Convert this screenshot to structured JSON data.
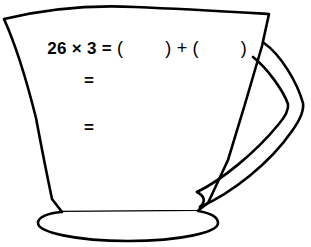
{
  "page": {
    "background_color": "#ffffff",
    "ink_color": "#000000"
  },
  "illustration": {
    "name": "cup-with-handle",
    "description": "Hand-drawn outline of a wide cup with an angular handle on the right side and an oval foot"
  },
  "equation": {
    "operand_1": "26",
    "times_symbol": "×",
    "operand_2": "3",
    "equals_symbol": "=",
    "open_paren": "(",
    "close_paren": ")",
    "blank_1": "",
    "plus_symbol": "+",
    "blank_2": "",
    "full_text": "26 × 3 = (      ) + (      )"
  },
  "work_lines": [
    {
      "label": "="
    },
    {
      "label": "="
    }
  ]
}
